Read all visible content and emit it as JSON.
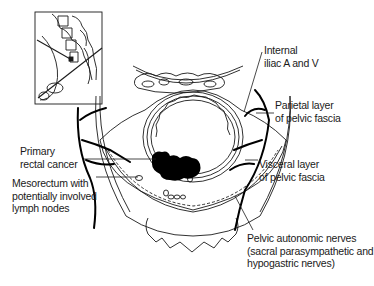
{
  "diagram": {
    "inset": {
      "description": "Sagittal pelvis inset with oblique section plane"
    },
    "labels": {
      "internal_iliac": [
        "Internal",
        "iliac A and V"
      ],
      "parietal_layer": [
        "Parietal layer",
        "of pelvic fascia"
      ],
      "visceral_layer": [
        "Visceral layer",
        "of pelvic fascia"
      ],
      "primary_cancer": [
        "Primary",
        "rectal cancer"
      ],
      "mesorectum": [
        "Mesorectum with",
        "potentially involved",
        "lymph nodes"
      ],
      "pelvic_nerves": [
        "Pelvic autonomic nerves",
        "(sacral parasympathetic and",
        "hypogastric nerves)"
      ]
    },
    "colors": {
      "line": "#1a1a1a",
      "background": "#ffffff",
      "tumor": "#000000"
    }
  }
}
